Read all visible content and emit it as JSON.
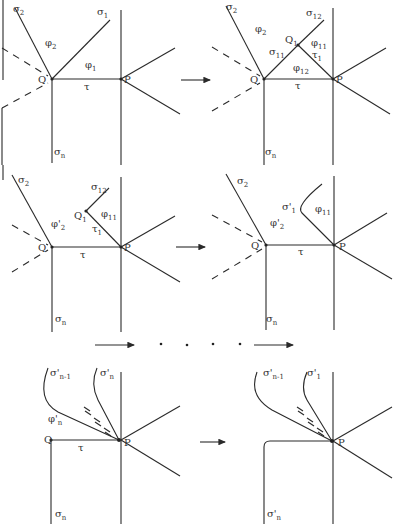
{
  "figure": {
    "stroke_color": "#2a2a2a",
    "background": "#ffffff"
  },
  "panels": [
    {
      "id": "panel-1",
      "labels": {
        "sigma2": {
          "base": "σ",
          "sub": "2"
        },
        "sigma1": {
          "base": "σ",
          "sub": "1"
        },
        "phi2": {
          "base": "φ",
          "sub": "2"
        },
        "phi1": {
          "base": "φ",
          "sub": "1"
        },
        "Q": {
          "base": "Q",
          "sub": ""
        },
        "P": {
          "base": "P",
          "sub": ""
        },
        "tau": {
          "base": "τ",
          "sub": ""
        },
        "sigman": {
          "base": "σ",
          "sub": "n"
        }
      }
    },
    {
      "id": "panel-2",
      "labels": {
        "sigma2": {
          "base": "σ",
          "sub": "2"
        },
        "sigma12": {
          "base": "σ",
          "sub": "12"
        },
        "phi2": {
          "base": "φ",
          "sub": "2"
        },
        "Q1": {
          "base": "Q",
          "sub": "1"
        },
        "phi11": {
          "base": "φ",
          "sub": "11"
        },
        "sigma11": {
          "base": "σ",
          "sub": "11"
        },
        "tau1": {
          "base": "τ",
          "sub": "1"
        },
        "phi12": {
          "base": "φ",
          "sub": "12"
        },
        "Q": {
          "base": "Q",
          "sub": ""
        },
        "P": {
          "base": "P",
          "sub": ""
        },
        "tau": {
          "base": "τ",
          "sub": ""
        },
        "sigman": {
          "base": "σ",
          "sub": "n"
        }
      }
    },
    {
      "id": "panel-3",
      "labels": {
        "sigma2": {
          "base": "σ",
          "sub": "2"
        },
        "sigma12": {
          "base": "σ",
          "sub": "12"
        },
        "Q1": {
          "base": "Q",
          "sub": "1"
        },
        "phi2p": {
          "base": "φ'",
          "sub": "2"
        },
        "phi11": {
          "base": "φ",
          "sub": "11"
        },
        "tau1": {
          "base": "τ",
          "sub": "1"
        },
        "Q": {
          "base": "Q",
          "sub": ""
        },
        "P": {
          "base": "P",
          "sub": ""
        },
        "tau": {
          "base": "τ",
          "sub": ""
        },
        "sigman": {
          "base": "σ",
          "sub": "n"
        }
      }
    },
    {
      "id": "panel-4",
      "labels": {
        "sigma2": {
          "base": "σ",
          "sub": "2"
        },
        "sigma1p": {
          "base": "σ'",
          "sub": "1"
        },
        "phi11": {
          "base": "φ",
          "sub": "11"
        },
        "phi2p": {
          "base": "φ'",
          "sub": "2"
        },
        "Q": {
          "base": "Q",
          "sub": ""
        },
        "P": {
          "base": "P",
          "sub": ""
        },
        "tau": {
          "base": "τ",
          "sub": ""
        },
        "sigman": {
          "base": "σ",
          "sub": "n"
        }
      }
    },
    {
      "id": "panel-5",
      "labels": {
        "sigmanm1p": {
          "base": "σ'",
          "sub": "n-1"
        },
        "sigmanp": {
          "base": "σ'",
          "sub": "n"
        },
        "phinp": {
          "base": "φ'",
          "sub": "n"
        },
        "Q": {
          "base": "Q",
          "sub": ""
        },
        "P": {
          "base": "P",
          "sub": ""
        },
        "tau": {
          "base": "τ",
          "sub": ""
        },
        "sigman": {
          "base": "σ",
          "sub": "n"
        }
      }
    },
    {
      "id": "panel-6",
      "labels": {
        "sigmanm1p": {
          "base": "σ'",
          "sub": "n-1"
        },
        "sigma1p": {
          "base": "σ'",
          "sub": "1"
        },
        "P": {
          "base": "P",
          "sub": ""
        },
        "sigmanp": {
          "base": "σ'",
          "sub": "n"
        }
      }
    }
  ],
  "transitions": [
    {
      "from": "panel-1",
      "to": "panel-2",
      "symbol": "→"
    },
    {
      "from": "panel-3",
      "to": "panel-4",
      "symbol": "→"
    },
    {
      "from": "panel-4",
      "to": "panel-5",
      "symbol": "→ · · · · →"
    },
    {
      "from": "panel-5",
      "to": "panel-6",
      "symbol": "→"
    }
  ]
}
